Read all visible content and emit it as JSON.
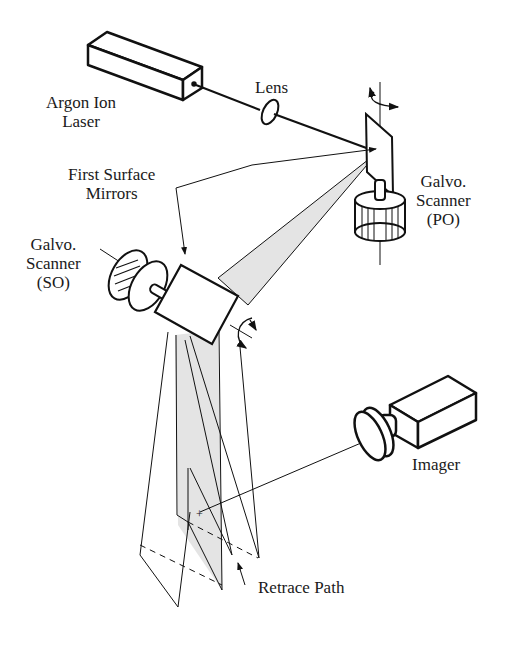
{
  "figure": {
    "type": "optical scanning system schematic",
    "labels": {
      "laser_line1": "Argon Ion",
      "laser_line2": "Laser",
      "lens": "Lens",
      "mirrors_line1": "First Surface",
      "mirrors_line2": "Mirrors",
      "galvo_po_line1": "Galvo.",
      "galvo_po_line2": "Scanner",
      "galvo_po_line3": "(PO)",
      "galvo_so_line1": "Galvo.",
      "galvo_so_line2": "Scanner",
      "galvo_so_line3": "(SO)",
      "imager": "Imager",
      "retrace": "Retrace Path"
    },
    "colors": {
      "line": "#111111",
      "beam_fill": "#e4e4e4",
      "background": "#ffffff"
    }
  }
}
